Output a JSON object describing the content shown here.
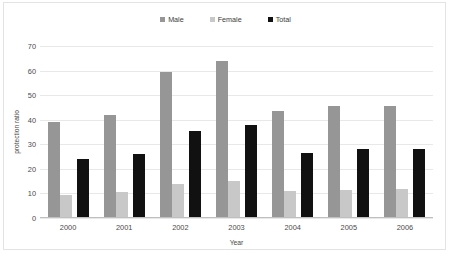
{
  "chart_data": {
    "type": "bar",
    "title": "",
    "xlabel": "Year",
    "ylabel": "protection ratio",
    "categories": [
      "2000",
      "2001",
      "2002",
      "2003",
      "2004",
      "2005",
      "2006"
    ],
    "series": [
      {
        "name": "Male",
        "color": "#969696",
        "values": [
          39,
          42,
          59.5,
          64,
          43.5,
          45.5,
          45.5
        ]
      },
      {
        "name": "Female",
        "color": "#c8c8c8",
        "values": [
          9.5,
          10.5,
          14,
          15,
          11,
          11.5,
          12
        ]
      },
      {
        "name": "Total",
        "color": "#111111",
        "values": [
          24,
          26,
          35.5,
          38,
          26.5,
          28,
          28
        ]
      }
    ],
    "ylim": [
      0,
      70
    ],
    "yticks": [
      0,
      10,
      20,
      30,
      40,
      50,
      60,
      70
    ],
    "ytick_labels": [
      "0",
      "10",
      "20",
      "30",
      "40",
      "50",
      "60",
      "70"
    ],
    "grid": true,
    "legend_position": "top-center"
  },
  "legend": {
    "items": [
      {
        "label": "Male",
        "color": "#969696"
      },
      {
        "label": "Female",
        "color": "#c8c8c8"
      },
      {
        "label": "Total",
        "color": "#111111"
      }
    ]
  }
}
